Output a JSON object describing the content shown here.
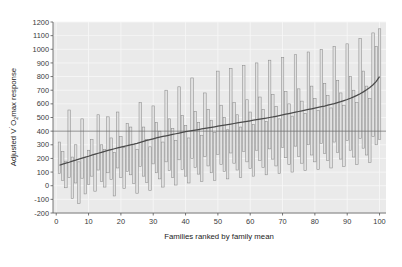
{
  "figure": {
    "background": "#ffffff",
    "plot_background": "#eaeaea",
    "gridline_color": "#f6f6f6",
    "bar_edge_color": "#8c8c8c",
    "bar_fill_color": "#e2e2e2",
    "trend_line_color": "#4a4a4a",
    "reference_line_color": "#6e6e6e",
    "axis_color": "#555555"
  },
  "axes": {
    "x": {
      "label": "Families ranked by family mean",
      "ticks": [
        0,
        10,
        20,
        30,
        40,
        50,
        60,
        70,
        80,
        90,
        100
      ],
      "tick_labels": [
        "0",
        "10",
        "20",
        "30",
        "40",
        "50",
        "60",
        "70",
        "80",
        "90",
        "100"
      ],
      "min": -1,
      "max": 102
    },
    "y": {
      "label_parts": {
        "prefix": "Adjusted V",
        "overdot": "̇",
        "o": "O",
        "subscript": "2",
        "suffix": "max response"
      },
      "label_plain": "Adjusted V̇O2max response",
      "ticks": [
        -200,
        -100,
        0,
        100,
        200,
        300,
        400,
        500,
        600,
        700,
        800,
        900,
        1000,
        1100,
        1200
      ],
      "tick_labels": [
        "-200",
        "-100",
        "0",
        "100",
        "200",
        "300",
        "400",
        "500",
        "600",
        "700",
        "800",
        "900",
        "1000",
        "1100",
        "1200"
      ],
      "min": -200,
      "max": 1200
    }
  },
  "chart_data": {
    "type": "bar",
    "subtype": "range-bars-with-trend-line",
    "title": "",
    "xlabel": "Families ranked by family mean",
    "ylabel": "Adjusted V̇O2max response",
    "xlim": [
      -1,
      102
    ],
    "ylim": [
      -200,
      1200
    ],
    "grid": true,
    "legend": "none",
    "reference_line": {
      "y": 400,
      "orientation": "horizontal",
      "label": ""
    },
    "categories": [
      1,
      2,
      3,
      4,
      5,
      6,
      7,
      8,
      9,
      10,
      11,
      12,
      13,
      14,
      15,
      16,
      17,
      18,
      19,
      20,
      21,
      22,
      23,
      24,
      25,
      26,
      27,
      28,
      29,
      30,
      31,
      32,
      33,
      34,
      35,
      36,
      37,
      38,
      39,
      40,
      41,
      42,
      43,
      44,
      45,
      46,
      47,
      48,
      49,
      50,
      51,
      52,
      53,
      54,
      55,
      56,
      57,
      58,
      59,
      60,
      61,
      62,
      63,
      64,
      65,
      66,
      67,
      68,
      69,
      70,
      71,
      72,
      73,
      74,
      75,
      76,
      77,
      78,
      79,
      80,
      81,
      82,
      83,
      84,
      85,
      86,
      87,
      88,
      89,
      90,
      91,
      92,
      93,
      94,
      95,
      96,
      97,
      98,
      99,
      100
    ],
    "series": [
      {
        "name": "Family range (min)",
        "values": [
          90,
          40,
          -15,
          60,
          -95,
          20,
          -130,
          55,
          -60,
          10,
          70,
          -40,
          115,
          30,
          -10,
          95,
          45,
          -75,
          130,
          60,
          -20,
          105,
          80,
          15,
          -55,
          140,
          70,
          25,
          -35,
          160,
          95,
          50,
          -10,
          175,
          110,
          60,
          5,
          190,
          120,
          70,
          20,
          200,
          135,
          85,
          30,
          215,
          145,
          95,
          40,
          230,
          155,
          105,
          50,
          240,
          165,
          115,
          60,
          250,
          175,
          125,
          70,
          260,
          185,
          135,
          80,
          270,
          195,
          145,
          90,
          280,
          205,
          155,
          100,
          290,
          215,
          165,
          110,
          300,
          225,
          175,
          120,
          310,
          235,
          185,
          130,
          320,
          245,
          195,
          140,
          330,
          260,
          210,
          155,
          345,
          275,
          225,
          170,
          360,
          300,
          340
        ]
      },
      {
        "name": "Family range (max)",
        "values": [
          320,
          250,
          180,
          555,
          210,
          300,
          175,
          490,
          205,
          260,
          340,
          230,
          520,
          300,
          265,
          505,
          350,
          245,
          540,
          360,
          280,
          455,
          430,
          300,
          265,
          610,
          430,
          340,
          285,
          585,
          465,
          400,
          320,
          700,
          490,
          420,
          330,
          725,
          515,
          440,
          350,
          790,
          545,
          465,
          370,
          680,
          560,
          480,
          390,
          840,
          590,
          500,
          410,
          860,
          610,
          520,
          430,
          880,
          630,
          540,
          450,
          900,
          650,
          560,
          470,
          920,
          670,
          580,
          490,
          940,
          690,
          600,
          510,
          960,
          710,
          620,
          530,
          980,
          730,
          640,
          550,
          1000,
          750,
          660,
          570,
          1020,
          770,
          680,
          590,
          1040,
          800,
          700,
          610,
          1080,
          840,
          730,
          640,
          1120,
          1020,
          1150
        ]
      },
      {
        "name": "Family mean",
        "values": [
          150,
          158,
          165,
          172,
          180,
          187,
          195,
          202,
          209,
          216,
          224,
          231,
          238,
          245,
          252,
          259,
          265,
          271,
          277,
          283,
          289,
          294,
          300,
          305,
          311,
          318,
          325,
          332,
          338,
          344,
          350,
          356,
          361,
          366,
          371,
          376,
          381,
          386,
          391,
          396,
          400,
          404,
          408,
          412,
          416,
          420,
          424,
          428,
          432,
          436,
          440,
          444,
          448,
          452,
          456,
          460,
          464,
          468,
          472,
          476,
          480,
          484,
          488,
          492,
          496,
          500,
          504,
          509,
          514,
          519,
          524,
          529,
          534,
          539,
          544,
          549,
          554,
          559,
          564,
          569,
          574,
          579,
          584,
          590,
          596,
          602,
          609,
          616,
          624,
          632,
          641,
          651,
          662,
          674,
          688,
          703,
          720,
          740,
          765,
          800
        ]
      }
    ]
  }
}
